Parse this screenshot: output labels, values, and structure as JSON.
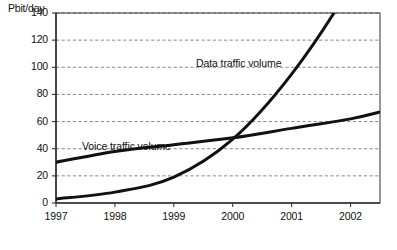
{
  "chart_data": {
    "type": "line",
    "title": "",
    "xlabel": "",
    "ylabel": "Pbit/day",
    "ylim": [
      0,
      140
    ],
    "xlim": [
      1997,
      2002.5
    ],
    "grid": true,
    "grid_style": "dashed-horizontal",
    "legend": "inline-annotations",
    "y_ticks": [
      0,
      20,
      40,
      60,
      80,
      100,
      120,
      140
    ],
    "y_tick_labels": [
      "0",
      "20",
      "40",
      "60",
      "80",
      "100",
      "120",
      "140"
    ],
    "x_ticks": [
      1997,
      1998,
      1999,
      2000,
      2001,
      2002
    ],
    "x_tick_labels": [
      "1997",
      "1998",
      "1999",
      "2000",
      "2001",
      "2002"
    ],
    "x": [
      1997,
      1998,
      1999,
      2000,
      2001,
      2002,
      2002.5
    ],
    "series": [
      {
        "name": "Voice traffic volume",
        "label": "Voice traffic volume",
        "values": [
          30,
          38,
          43,
          48,
          55,
          62,
          67
        ],
        "color": "#111111",
        "style": "solid",
        "width": 3
      },
      {
        "name": "Data traffic volume",
        "label": "Data traffic volume",
        "values": [
          3,
          8,
          19,
          47,
          95,
          160,
          205
        ],
        "color": "#111111",
        "style": "solid",
        "width": 3,
        "note": "exceeds plot top (140) between 2001 and 2002; clipped at axis"
      }
    ],
    "annotations": [
      {
        "text": "Voice traffic volume",
        "series": "Voice traffic volume"
      },
      {
        "text": "Data traffic volume",
        "series": "Data traffic volume"
      }
    ],
    "crossover": {
      "x": 1999.85,
      "y": 47
    }
  },
  "axis": {
    "unit_label": "Pbit/day"
  },
  "colors": {
    "line": "#111111",
    "axis": "#333333",
    "grid": "#7a7a7a",
    "background": "#ffffff",
    "text": "#111111"
  }
}
